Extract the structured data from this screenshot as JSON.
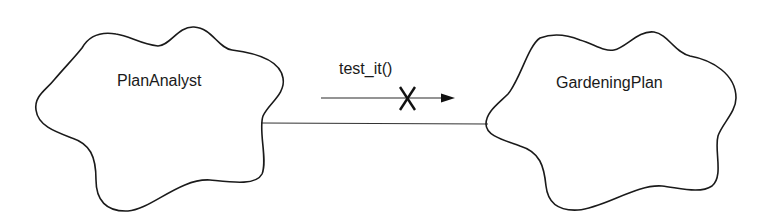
{
  "diagram": {
    "objects": [
      {
        "id": "left",
        "name": "PlanAnalyst"
      },
      {
        "id": "right",
        "name": "GardeningPlan"
      }
    ],
    "link": {
      "from": "PlanAnalyst",
      "to": "GardeningPlan"
    },
    "message": {
      "label": "test_it()",
      "direction": "PlanAnalyst → GardeningPlan",
      "marker": "X"
    }
  }
}
